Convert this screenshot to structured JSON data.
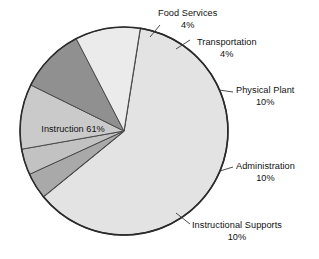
{
  "chart_data": {
    "type": "pie",
    "title": "",
    "subtitle": "",
    "xlabel": "",
    "ylabel": "",
    "legend_position": "callout-labels",
    "grid": false,
    "unit": "%",
    "categories": [
      "Instruction",
      "Food Services",
      "Transportation",
      "Physical Plant",
      "Administration",
      "Instructional Supports"
    ],
    "values": [
      61,
      4,
      4,
      10,
      10,
      10
    ],
    "slices": [
      {
        "name": "Instruction",
        "value": 61,
        "label": "Instruction",
        "percent_label": "61%",
        "color": "#e3e3e3",
        "label_placement": "inside"
      },
      {
        "name": "Food Services",
        "value": 4,
        "label": "Food Services",
        "percent_label": "4%",
        "color": "#a9a9a9",
        "label_placement": "callout"
      },
      {
        "name": "Transportation",
        "value": 4,
        "label": "Transportation",
        "percent_label": "4%",
        "color": "#c2c2c2",
        "label_placement": "callout"
      },
      {
        "name": "Physical Plant",
        "value": 10,
        "label": "Physical Plant",
        "percent_label": "10%",
        "color": "#cacaca",
        "label_placement": "callout"
      },
      {
        "name": "Administration",
        "value": 10,
        "label": "Administration",
        "percent_label": "10%",
        "color": "#909090",
        "label_placement": "callout"
      },
      {
        "name": "Instructional Supports",
        "value": 10,
        "label": "Instructional Supports",
        "percent_label": "10%",
        "color": "#ebebeb",
        "label_placement": "callout"
      }
    ],
    "colors": {
      "outline": "#2b2b2b",
      "slice_divider": "#4a4a4a",
      "leader_line": "#3a3a3a",
      "background": "#ffffff",
      "text": "#111111"
    }
  }
}
